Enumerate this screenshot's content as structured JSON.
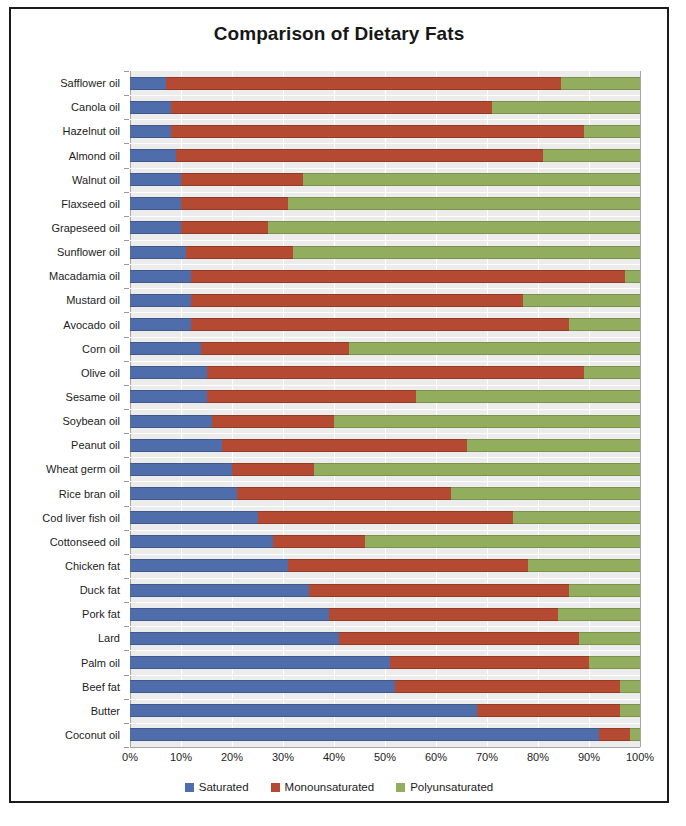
{
  "chart_data": {
    "type": "bar",
    "subtype": "horizontal-stacked-100pct",
    "title": "Comparison of Dietary Fats",
    "xlabel": "",
    "ylabel": "",
    "xlim": [
      0,
      100
    ],
    "xticks": [
      "0%",
      "10%",
      "20%",
      "30%",
      "40%",
      "50%",
      "60%",
      "70%",
      "80%",
      "90%",
      "100%"
    ],
    "xtick_values": [
      0,
      10,
      20,
      30,
      40,
      50,
      60,
      70,
      80,
      90,
      100
    ],
    "grid": true,
    "legend_position": "bottom",
    "legend": [
      "Saturated",
      "Monounsaturated",
      "Polyunsaturated"
    ],
    "colors": {
      "saturated": "#4f6daa",
      "monounsaturated": "#b44a31",
      "polyunsaturated": "#93ad5e",
      "plot_background": "#ececec",
      "frame": "#1b1b1b"
    },
    "categories": [
      "Safflower oil",
      "Canola oil",
      "Hazelnut oil",
      "Almond oil",
      "Walnut oil",
      "Flaxseed oil",
      "Grapeseed oil",
      "Sunflower oil",
      "Macadamia oil",
      "Mustard oil",
      "Avocado oil",
      "Corn oil",
      "Olive oil",
      "Sesame oil",
      "Soybean oil",
      "Peanut oil",
      "Wheat germ oil",
      "Rice bran oil",
      "Cod liver fish oil",
      "Cottonseed oil",
      "Chicken fat",
      "Duck fat",
      "Pork fat",
      "Lard",
      "Palm oil",
      "Beef fat",
      "Butter",
      "Coconut oil"
    ],
    "series": [
      {
        "name": "Saturated",
        "color": "#4f6daa",
        "values": [
          7,
          8,
          8,
          9,
          10,
          10,
          10,
          11,
          12,
          12,
          12,
          14,
          15,
          15,
          16,
          18,
          20,
          21,
          25,
          28,
          31,
          35,
          39,
          41,
          51,
          52,
          68,
          92
        ]
      },
      {
        "name": "Monounsaturated",
        "color": "#b44a31",
        "values": [
          77.5,
          63,
          81,
          72,
          24,
          21,
          17,
          21,
          85,
          65,
          74,
          29,
          74,
          41,
          24,
          48,
          16,
          42,
          50,
          18,
          47,
          51,
          45,
          47,
          39,
          44,
          28,
          6
        ]
      },
      {
        "name": "Polyunsaturated",
        "color": "#93ad5e",
        "values": [
          15.5,
          29,
          11,
          19,
          66,
          69,
          73,
          68,
          3,
          23,
          14,
          57,
          11,
          44,
          60,
          34,
          64,
          37,
          25,
          54,
          22,
          14,
          16,
          12,
          10,
          4,
          4,
          2
        ]
      }
    ],
    "cumulative_endpoints": [
      {
        "category": "Safflower oil",
        "sat_end": 7,
        "mono_end": 84.5,
        "poly_end": 100
      },
      {
        "category": "Canola oil",
        "sat_end": 8,
        "mono_end": 71,
        "poly_end": 100
      },
      {
        "category": "Hazelnut oil",
        "sat_end": 8,
        "mono_end": 89,
        "poly_end": 100
      },
      {
        "category": "Almond oil",
        "sat_end": 9,
        "mono_end": 81,
        "poly_end": 100
      },
      {
        "category": "Walnut oil",
        "sat_end": 10,
        "mono_end": 34,
        "poly_end": 100
      },
      {
        "category": "Flaxseed oil",
        "sat_end": 10,
        "mono_end": 31,
        "poly_end": 100
      },
      {
        "category": "Grapeseed oil",
        "sat_end": 10,
        "mono_end": 27,
        "poly_end": 100
      },
      {
        "category": "Sunflower oil",
        "sat_end": 11,
        "mono_end": 32,
        "poly_end": 100
      },
      {
        "category": "Macadamia oil",
        "sat_end": 12,
        "mono_end": 97,
        "poly_end": 100
      },
      {
        "category": "Mustard oil",
        "sat_end": 12,
        "mono_end": 77,
        "poly_end": 100
      },
      {
        "category": "Avocado oil",
        "sat_end": 12,
        "mono_end": 86,
        "poly_end": 100
      },
      {
        "category": "Corn oil",
        "sat_end": 14,
        "mono_end": 43,
        "poly_end": 100
      },
      {
        "category": "Olive oil",
        "sat_end": 15,
        "mono_end": 89,
        "poly_end": 100
      },
      {
        "category": "Sesame oil",
        "sat_end": 15,
        "mono_end": 56,
        "poly_end": 100
      },
      {
        "category": "Soybean oil",
        "sat_end": 16,
        "mono_end": 40,
        "poly_end": 100
      },
      {
        "category": "Peanut oil",
        "sat_end": 18,
        "mono_end": 66,
        "poly_end": 100
      },
      {
        "category": "Wheat germ oil",
        "sat_end": 20,
        "mono_end": 36,
        "poly_end": 100
      },
      {
        "category": "Rice bran oil",
        "sat_end": 21,
        "mono_end": 63,
        "poly_end": 100
      },
      {
        "category": "Cod liver fish oil",
        "sat_end": 25,
        "mono_end": 75,
        "poly_end": 100
      },
      {
        "category": "Cottonseed oil",
        "sat_end": 28,
        "mono_end": 46,
        "poly_end": 100
      },
      {
        "category": "Chicken fat",
        "sat_end": 31,
        "mono_end": 78,
        "poly_end": 100
      },
      {
        "category": "Duck fat",
        "sat_end": 35,
        "mono_end": 86,
        "poly_end": 100
      },
      {
        "category": "Pork fat",
        "sat_end": 39,
        "mono_end": 84,
        "poly_end": 100
      },
      {
        "category": "Lard",
        "sat_end": 41,
        "mono_end": 88,
        "poly_end": 100
      },
      {
        "category": "Palm oil",
        "sat_end": 51,
        "mono_end": 90,
        "poly_end": 100
      },
      {
        "category": "Beef fat",
        "sat_end": 52,
        "mono_end": 96,
        "poly_end": 100
      },
      {
        "category": "Butter",
        "sat_end": 68,
        "mono_end": 96,
        "poly_end": 100
      },
      {
        "category": "Coconut oil",
        "sat_end": 92,
        "mono_end": 98,
        "poly_end": 100
      }
    ]
  }
}
